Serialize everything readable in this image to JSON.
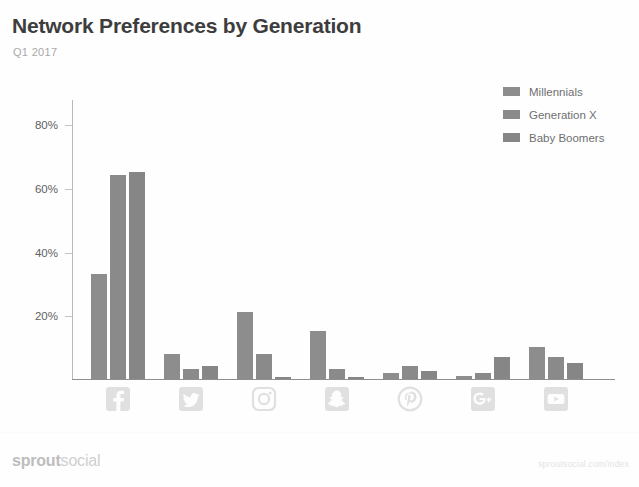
{
  "header": {
    "title": "Network Preferences by Generation",
    "subtitle": "Q1 2017"
  },
  "footer": {
    "logo_bold": "sprout",
    "logo_light": "social",
    "url": "sproutsocial.com/index"
  },
  "colors": {
    "series_millennials": "#8d8d8d",
    "series_generation_x": "#8a8a8a",
    "series_baby_boomers": "#868686",
    "axis": "#8f8f8f",
    "tick_label": "#5f5f5f",
    "title": "#3d3d3d",
    "subtitle": "#a9a9a9",
    "icon": "#e0e0e0"
  },
  "legend": {
    "position": "top-right",
    "items": [
      {
        "label": "Millennials",
        "color": "#8d8d8d"
      },
      {
        "label": "Generation X",
        "color": "#8a8a8a"
      },
      {
        "label": "Baby Boomers",
        "color": "#868686"
      }
    ]
  },
  "axis": {
    "y_ticks": [
      "20%",
      "40%",
      "60%",
      "80%"
    ],
    "y_tick_values": [
      20,
      40,
      60,
      80
    ],
    "y_min": 0,
    "y_max": 88,
    "grid": false
  },
  "icons": [
    {
      "name": "facebook-icon",
      "label": "Facebook"
    },
    {
      "name": "twitter-icon",
      "label": "Twitter"
    },
    {
      "name": "instagram-icon",
      "label": "Instagram"
    },
    {
      "name": "snapchat-icon",
      "label": "Snapchat"
    },
    {
      "name": "pinterest-icon",
      "label": "Pinterest"
    },
    {
      "name": "googleplus-icon",
      "label": "Google+"
    },
    {
      "name": "youtube-icon",
      "label": "YouTube"
    }
  ],
  "chart_data": {
    "type": "bar",
    "title": "Network Preferences by Generation",
    "subtitle": "Q1 2017",
    "xlabel": "",
    "ylabel": "",
    "ylim": [
      0,
      88
    ],
    "ytick_labels": [
      "20%",
      "40%",
      "60%",
      "80%"
    ],
    "grid": false,
    "legend_position": "top-right",
    "categories": [
      "Facebook",
      "Twitter",
      "Instagram",
      "Snapchat",
      "Pinterest",
      "Google+",
      "YouTube"
    ],
    "series": [
      {
        "name": "Millennials",
        "color": "#8d8d8d",
        "values": [
          33,
          8,
          21,
          15,
          2,
          1,
          10
        ]
      },
      {
        "name": "Generation X",
        "color": "#8a8a8a",
        "values": [
          64,
          3,
          8,
          3,
          4,
          2,
          7
        ]
      },
      {
        "name": "Baby Boomers",
        "color": "#868686",
        "values": [
          65,
          4,
          0.5,
          0.5,
          2.5,
          7,
          5
        ]
      }
    ]
  }
}
